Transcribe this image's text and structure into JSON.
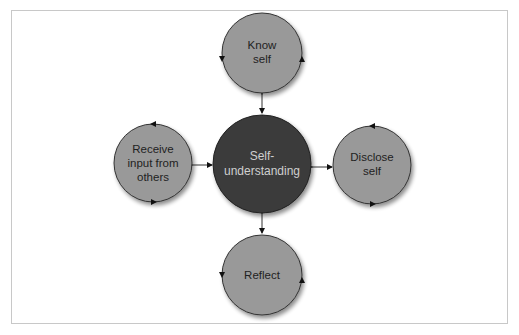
{
  "diagram": {
    "center": {
      "label_line1": "Self-",
      "label_line2": "understanding",
      "fill": "#3a3a3a"
    },
    "nodes": {
      "top": {
        "label_line1": "Know",
        "label_line2": "self"
      },
      "right": {
        "label_line1": "Disclose",
        "label_line2": "self"
      },
      "bottom": {
        "label_line1": "Reflect"
      },
      "left": {
        "label_line1": "Receive",
        "label_line2": "input from",
        "label_line3": "others"
      }
    },
    "node_fill": "#999999",
    "connector": "bidirectional-arrow"
  }
}
